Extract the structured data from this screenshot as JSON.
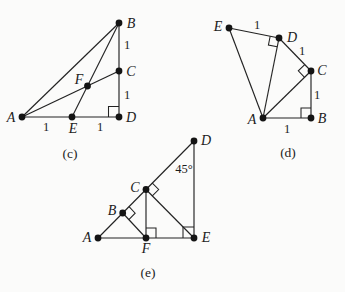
{
  "style": {
    "background": "#fbfbfa",
    "line_color": "#222222",
    "dot_color": "#141414",
    "text_color": "#1c1c1c"
  },
  "figures": [
    {
      "id": "c",
      "caption": {
        "text": "(c)",
        "x": 70,
        "y": 158
      },
      "points": {
        "A": {
          "x": 22,
          "y": 117
        },
        "B": {
          "x": 119,
          "y": 23
        },
        "C": {
          "x": 119,
          "y": 71
        },
        "D": {
          "x": 119,
          "y": 117
        },
        "E": {
          "x": 72,
          "y": 117
        },
        "F": {
          "x": 87.5,
          "y": 86
        }
      },
      "edges": [
        [
          "A",
          "B"
        ],
        [
          "A",
          "D"
        ],
        [
          "B",
          "D"
        ],
        [
          "A",
          "C"
        ],
        [
          "B",
          "E"
        ]
      ],
      "point_labels": [
        {
          "text": "A",
          "x": 11,
          "y": 122
        },
        {
          "text": "B",
          "x": 131,
          "y": 28
        },
        {
          "text": "C",
          "x": 131,
          "y": 76
        },
        {
          "text": "D",
          "x": 131,
          "y": 122
        },
        {
          "text": "E",
          "x": 73,
          "y": 133
        },
        {
          "text": "F",
          "x": 79,
          "y": 84
        }
      ],
      "side_labels": [
        {
          "text": "1",
          "x": 46,
          "y": 131
        },
        {
          "text": "1",
          "x": 100,
          "y": 131
        },
        {
          "text": "1",
          "x": 127,
          "y": 49
        },
        {
          "text": "1",
          "x": 127,
          "y": 99
        }
      ],
      "angle_labels": [],
      "right_angles": [
        {
          "at": "D",
          "toward": [
            "C",
            "A"
          ],
          "size": 10.5
        }
      ]
    },
    {
      "id": "d",
      "caption": {
        "text": "(d)",
        "x": 288,
        "y": 157
      },
      "points": {
        "E": {
          "x": 229,
          "y": 28
        },
        "D": {
          "x": 279,
          "y": 38
        },
        "C": {
          "x": 311,
          "y": 71
        },
        "A": {
          "x": 263,
          "y": 118
        },
        "B": {
          "x": 311,
          "y": 118
        }
      },
      "edges": [
        [
          "E",
          "D"
        ],
        [
          "E",
          "A"
        ],
        [
          "D",
          "A"
        ],
        [
          "D",
          "C"
        ],
        [
          "C",
          "A"
        ],
        [
          "C",
          "B"
        ],
        [
          "A",
          "B"
        ]
      ],
      "point_labels": [
        {
          "text": "E",
          "x": 218,
          "y": 31
        },
        {
          "text": "D",
          "x": 292,
          "y": 42
        },
        {
          "text": "C",
          "x": 322,
          "y": 75
        },
        {
          "text": "A",
          "x": 252,
          "y": 124
        },
        {
          "text": "B",
          "x": 322,
          "y": 123
        }
      ],
      "side_labels": [
        {
          "text": "1",
          "x": 257,
          "y": 29
        },
        {
          "text": "1",
          "x": 302,
          "y": 55
        },
        {
          "text": "1",
          "x": 317,
          "y": 99
        },
        {
          "text": "1",
          "x": 287,
          "y": 133
        }
      ],
      "angle_labels": [],
      "right_angles": [
        {
          "at": "D",
          "toward": [
            "E",
            "A"
          ],
          "size": 9
        },
        {
          "at": "C",
          "toward": [
            "D",
            "A"
          ],
          "size": 9
        },
        {
          "at": "B",
          "toward": [
            "A",
            "C"
          ],
          "size": 10
        }
      ]
    },
    {
      "id": "e",
      "caption": {
        "text": "(e)",
        "x": 148,
        "y": 277
      },
      "points": {
        "A": {
          "x": 98,
          "y": 238
        },
        "B": {
          "x": 122.7,
          "y": 213
        },
        "C": {
          "x": 146,
          "y": 189.5
        },
        "D": {
          "x": 194,
          "y": 141
        },
        "E": {
          "x": 194,
          "y": 238
        },
        "F": {
          "x": 146,
          "y": 238
        }
      },
      "edges": [
        [
          "A",
          "D"
        ],
        [
          "A",
          "E"
        ],
        [
          "D",
          "E"
        ],
        [
          "C",
          "F"
        ],
        [
          "C",
          "E"
        ],
        [
          "B",
          "F"
        ]
      ],
      "point_labels": [
        {
          "text": "A",
          "x": 87,
          "y": 242
        },
        {
          "text": "B",
          "x": 112,
          "y": 215
        },
        {
          "text": "C",
          "x": 135,
          "y": 192
        },
        {
          "text": "D",
          "x": 206,
          "y": 145
        },
        {
          "text": "E",
          "x": 206,
          "y": 242
        },
        {
          "text": "F",
          "x": 146,
          "y": 253
        }
      ],
      "side_labels": [],
      "angle_labels": [
        {
          "text": "45°",
          "x": 184,
          "y": 173
        }
      ],
      "right_angles": [
        {
          "at": "B",
          "toward": [
            "D",
            "F"
          ],
          "size": 9
        },
        {
          "at": "C",
          "toward": [
            "D",
            "E"
          ],
          "size": 9
        },
        {
          "at": "F",
          "toward": [
            "C",
            "E"
          ],
          "size": 10
        },
        {
          "at": "E",
          "toward": [
            "F",
            "D"
          ],
          "size": 11
        }
      ]
    }
  ]
}
